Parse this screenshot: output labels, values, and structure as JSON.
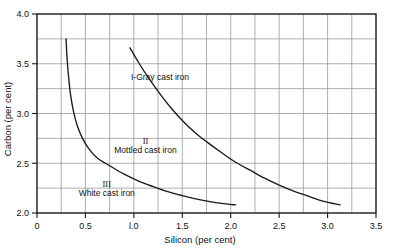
{
  "chart_data": {
    "type": "line",
    "title": "",
    "xlabel": "Silicon (per cent)",
    "ylabel": "Carbon (per cent)",
    "xlim": [
      0,
      3.5
    ],
    "ylim": [
      2.0,
      4.0
    ],
    "grid": true,
    "grid_x_step": 0.25,
    "grid_y_step": 0.25,
    "legend": "inline-annotations",
    "xticks": [
      "0",
      "0.5",
      "l.0",
      "1.5",
      "2.0",
      "2.5",
      "3.0",
      "3.5"
    ],
    "xtick_values": [
      0,
      0.5,
      1.0,
      1.5,
      2.0,
      2.5,
      3.0,
      3.5
    ],
    "yticks": [
      "2.0",
      "2.5",
      "3.0",
      "3.5",
      "4.0"
    ],
    "ytick_values": [
      2.0,
      2.5,
      3.0,
      3.5,
      4.0
    ],
    "annotations": [
      {
        "id": "region-1",
        "roman": "I",
        "text": "I-Gray cast iron",
        "x": 1.27,
        "y": 3.34
      },
      {
        "id": "region-2",
        "roman": "II",
        "text": "Mottled cast iron",
        "x": 1.12,
        "y": 2.6
      },
      {
        "id": "region-3",
        "roman": "III",
        "text": "White cast iron",
        "x": 0.72,
        "y": 2.17
      }
    ],
    "series": [
      {
        "name": "White / Mottled boundary",
        "label": "III",
        "points": [
          [
            0.3,
            3.75
          ],
          [
            0.31,
            3.56
          ],
          [
            0.325,
            3.38
          ],
          [
            0.345,
            3.2
          ],
          [
            0.375,
            3.03
          ],
          [
            0.415,
            2.88
          ],
          [
            0.47,
            2.75
          ],
          [
            0.54,
            2.64
          ],
          [
            0.625,
            2.55
          ],
          [
            0.75,
            2.475
          ],
          [
            0.9,
            2.39
          ],
          [
            1.05,
            2.32
          ],
          [
            1.2,
            2.265
          ],
          [
            1.35,
            2.215
          ],
          [
            1.5,
            2.175
          ],
          [
            1.65,
            2.14
          ],
          [
            1.8,
            2.112
          ],
          [
            1.95,
            2.092
          ],
          [
            2.05,
            2.082
          ]
        ]
      },
      {
        "name": "Mottled / Gray boundary",
        "label": "I",
        "points": [
          [
            0.96,
            3.66
          ],
          [
            1.05,
            3.51
          ],
          [
            1.15,
            3.36
          ],
          [
            1.26,
            3.21
          ],
          [
            1.38,
            3.06
          ],
          [
            1.5,
            2.93
          ],
          [
            1.63,
            2.81
          ],
          [
            1.76,
            2.71
          ],
          [
            1.9,
            2.61
          ],
          [
            2.05,
            2.51
          ],
          [
            2.2,
            2.43
          ],
          [
            2.35,
            2.35
          ],
          [
            2.5,
            2.28
          ],
          [
            2.65,
            2.22
          ],
          [
            2.8,
            2.17
          ],
          [
            2.95,
            2.12
          ],
          [
            3.13,
            2.082
          ]
        ]
      }
    ]
  }
}
